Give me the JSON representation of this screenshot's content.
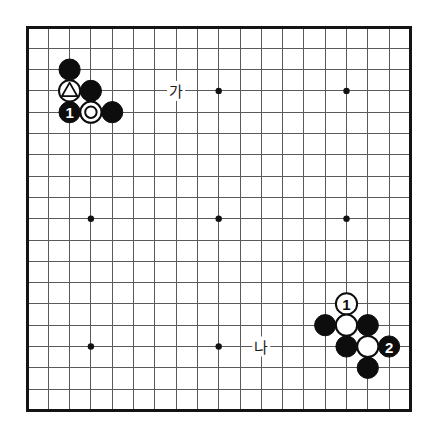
{
  "figure": {
    "name": "go-board-diagram",
    "type": "go-board",
    "size": 19,
    "background_color": "#ffffff",
    "line_color": "#5a5a5a",
    "border_color": "#141414",
    "black_color": "#0d0d0d",
    "white_color": "#ffffff"
  },
  "geometry": {
    "origin_x": 27,
    "origin_y": 27,
    "spacing": 21.3,
    "stone_radius": 10.6,
    "star_radius": 3.2
  },
  "star_points": [
    {
      "col": 3,
      "row": 3
    },
    {
      "col": 9,
      "row": 3
    },
    {
      "col": 15,
      "row": 3
    },
    {
      "col": 3,
      "row": 9
    },
    {
      "col": 9,
      "row": 9
    },
    {
      "col": 15,
      "row": 9
    },
    {
      "col": 3,
      "row": 15
    },
    {
      "col": 9,
      "row": 15
    },
    {
      "col": 15,
      "row": 15
    }
  ],
  "stones": [
    {
      "id": "b-top-left-upper",
      "color": "black",
      "col": 2,
      "row": 2,
      "mark": "none",
      "label": ""
    },
    {
      "id": "w-triangle",
      "color": "white",
      "col": 2,
      "row": 3,
      "mark": "triangle",
      "label": ""
    },
    {
      "id": "b-upper-right-of-triangle",
      "color": "black",
      "col": 3,
      "row": 3,
      "mark": "none",
      "label": ""
    },
    {
      "id": "b-move-1-topleft",
      "color": "black",
      "col": 2,
      "row": 4,
      "mark": "none",
      "label": "1"
    },
    {
      "id": "w-circle",
      "color": "white",
      "col": 3,
      "row": 4,
      "mark": "circle",
      "label": ""
    },
    {
      "id": "b-right-of-circle",
      "color": "black",
      "col": 4,
      "row": 4,
      "mark": "none",
      "label": ""
    },
    {
      "id": "w-move-1-bottomright",
      "color": "white",
      "col": 15,
      "row": 13,
      "mark": "none",
      "label": "1"
    },
    {
      "id": "b-br-left",
      "color": "black",
      "col": 14,
      "row": 14,
      "mark": "none",
      "label": ""
    },
    {
      "id": "w-br-center-upper",
      "color": "white",
      "col": 15,
      "row": 14,
      "mark": "none",
      "label": ""
    },
    {
      "id": "b-br-right-upper",
      "color": "black",
      "col": 16,
      "row": 14,
      "mark": "none",
      "label": ""
    },
    {
      "id": "b-br-center-lower",
      "color": "black",
      "col": 15,
      "row": 15,
      "mark": "none",
      "label": ""
    },
    {
      "id": "w-br-center-lower-right",
      "color": "white",
      "col": 16,
      "row": 15,
      "mark": "none",
      "label": ""
    },
    {
      "id": "b-move-2-bottomright",
      "color": "black",
      "col": 17,
      "row": 15,
      "mark": "none",
      "label": "2"
    },
    {
      "id": "b-br-bottom",
      "color": "black",
      "col": 16,
      "row": 16,
      "mark": "none",
      "label": ""
    }
  ],
  "point_labels": [
    {
      "id": "label-ga",
      "text": "가",
      "col": 7,
      "row": 3
    },
    {
      "id": "label-na",
      "text": "나",
      "col": 11,
      "row": 15
    }
  ]
}
